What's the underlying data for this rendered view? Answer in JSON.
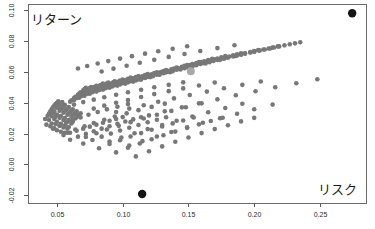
{
  "figure": {
    "width": 375,
    "height": 229,
    "background": "#ffffff",
    "plot_area": {
      "left": 28,
      "top": 4,
      "right": 366,
      "bottom": 203
    }
  },
  "labels": {
    "return_label": "リターン",
    "risk_label": "リスク"
  },
  "colors": {
    "point": "#787878",
    "highlight_dark": "#141414",
    "highlight_light": "#a9a9a9",
    "axis": "#5a5a5a",
    "text": "#1c1c1c"
  },
  "chart_data": {
    "type": "scatter",
    "title": "",
    "subtitle": "",
    "xlabel": "リスク",
    "ylabel": "リターン",
    "xlim": [
      0.028,
      0.285
    ],
    "ylim": [
      -0.025,
      0.104
    ],
    "grid": false,
    "legend": null,
    "xticks": [
      0.05,
      0.1,
      0.15,
      0.2,
      0.25
    ],
    "xticklabels": [
      "0.05",
      "0.10",
      "0.15",
      "0.20",
      "0.25"
    ],
    "yticks": [
      -0.02,
      0.0,
      0.02,
      0.04,
      0.06,
      0.08,
      0.1
    ],
    "yticklabels": [
      "-0.02",
      "0.00",
      "0.02",
      "0.04",
      "0.06",
      "0.08",
      "0.10"
    ],
    "marker_size": 2.3,
    "series": [
      {
        "name": "portfolios",
        "color": "#787878",
        "marker": "circle",
        "x": [
          0.041,
          0.043,
          0.044,
          0.045,
          0.046,
          0.047,
          0.048,
          0.049,
          0.05,
          0.051,
          0.042,
          0.044,
          0.046,
          0.047,
          0.048,
          0.05,
          0.051,
          0.052,
          0.053,
          0.054,
          0.045,
          0.046,
          0.048,
          0.049,
          0.05,
          0.052,
          0.053,
          0.054,
          0.055,
          0.056,
          0.047,
          0.049,
          0.05,
          0.052,
          0.053,
          0.055,
          0.056,
          0.057,
          0.058,
          0.059,
          0.05,
          0.052,
          0.053,
          0.055,
          0.056,
          0.058,
          0.059,
          0.06,
          0.061,
          0.062,
          0.053,
          0.055,
          0.056,
          0.058,
          0.059,
          0.061,
          0.062,
          0.063,
          0.064,
          0.065,
          0.056,
          0.058,
          0.059,
          0.061,
          0.062,
          0.064,
          0.065,
          0.066,
          0.067,
          0.068,
          0.06,
          0.061,
          0.063,
          0.064,
          0.066,
          0.067,
          0.068,
          0.07,
          0.071,
          0.072,
          0.063,
          0.065,
          0.066,
          0.068,
          0.069,
          0.071,
          0.072,
          0.073,
          0.075,
          0.076,
          0.067,
          0.069,
          0.07,
          0.072,
          0.073,
          0.075,
          0.076,
          0.078,
          0.079,
          0.08,
          0.071,
          0.073,
          0.074,
          0.076,
          0.077,
          0.079,
          0.08,
          0.082,
          0.083,
          0.085,
          0.075,
          0.077,
          0.079,
          0.08,
          0.082,
          0.083,
          0.085,
          0.086,
          0.088,
          0.089,
          0.08,
          0.082,
          0.083,
          0.085,
          0.087,
          0.088,
          0.09,
          0.091,
          0.093,
          0.094,
          0.085,
          0.087,
          0.089,
          0.09,
          0.092,
          0.094,
          0.095,
          0.097,
          0.098,
          0.1,
          0.09,
          0.092,
          0.094,
          0.096,
          0.097,
          0.099,
          0.101,
          0.102,
          0.104,
          0.106,
          0.096,
          0.098,
          0.1,
          0.101,
          0.103,
          0.105,
          0.107,
          0.108,
          0.11,
          0.112,
          0.102,
          0.104,
          0.106,
          0.108,
          0.11,
          0.111,
          0.113,
          0.115,
          0.117,
          0.119,
          0.108,
          0.11,
          0.112,
          0.114,
          0.116,
          0.118,
          0.12,
          0.122,
          0.124,
          0.126,
          0.114,
          0.117,
          0.119,
          0.121,
          0.123,
          0.125,
          0.127,
          0.129,
          0.131,
          0.133,
          0.121,
          0.123,
          0.126,
          0.128,
          0.13,
          0.132,
          0.134,
          0.137,
          0.139,
          0.141,
          0.128,
          0.131,
          0.133,
          0.135,
          0.138,
          0.14,
          0.142,
          0.145,
          0.147,
          0.149,
          0.136,
          0.138,
          0.141,
          0.143,
          0.146,
          0.148,
          0.151,
          0.153,
          0.156,
          0.158,
          0.144,
          0.147,
          0.149,
          0.152,
          0.155,
          0.157,
          0.16,
          0.162,
          0.165,
          0.168,
          0.153,
          0.156,
          0.159,
          0.161,
          0.164,
          0.167,
          0.17,
          0.172,
          0.175,
          0.178,
          0.163,
          0.166,
          0.169,
          0.172,
          0.175,
          0.178,
          0.181,
          0.184,
          0.187,
          0.19,
          0.174,
          0.177,
          0.18,
          0.184,
          0.187,
          0.19,
          0.193,
          0.197,
          0.2,
          0.203,
          0.186,
          0.19,
          0.193,
          0.197,
          0.2,
          0.204,
          0.207,
          0.211,
          0.214,
          0.218,
          0.2,
          0.204,
          0.208,
          0.212,
          0.215,
          0.219,
          0.223,
          0.227,
          0.231,
          0.235,
          0.055,
          0.06,
          0.065,
          0.07,
          0.075,
          0.08,
          0.085,
          0.09,
          0.095,
          0.1,
          0.06,
          0.066,
          0.072,
          0.078,
          0.084,
          0.09,
          0.096,
          0.102,
          0.108,
          0.114,
          0.07,
          0.077,
          0.084,
          0.091,
          0.098,
          0.105,
          0.112,
          0.119,
          0.126,
          0.133,
          0.082,
          0.09,
          0.098,
          0.106,
          0.114,
          0.122,
          0.13,
          0.138,
          0.146,
          0.154,
          0.095,
          0.104,
          0.113,
          0.122,
          0.131,
          0.14,
          0.149,
          0.158,
          0.167,
          0.176,
          0.11,
          0.12,
          0.13,
          0.14,
          0.15,
          0.16,
          0.17,
          0.18,
          0.19,
          0.2,
          0.048,
          0.052,
          0.057,
          0.062,
          0.068,
          0.074,
          0.081,
          0.088,
          0.096,
          0.104,
          0.058,
          0.064,
          0.071,
          0.078,
          0.086,
          0.094,
          0.103,
          0.112,
          0.122,
          0.132,
          0.072,
          0.08,
          0.088,
          0.097,
          0.106,
          0.116,
          0.126,
          0.137,
          0.148,
          0.16,
          0.09,
          0.099,
          0.109,
          0.119,
          0.13,
          0.141,
          0.153,
          0.165,
          0.178,
          0.191,
          0.105,
          0.115,
          0.126,
          0.137,
          0.149,
          0.161,
          0.174,
          0.187,
          0.2,
          0.214,
          0.063,
          0.07,
          0.078,
          0.086,
          0.095,
          0.104,
          0.114,
          0.124,
          0.135,
          0.146,
          0.078,
          0.086,
          0.095,
          0.104,
          0.114,
          0.124,
          0.135,
          0.146,
          0.158,
          0.17,
          0.095,
          0.105,
          0.116,
          0.127,
          0.139,
          0.151,
          0.164,
          0.177,
          0.191,
          0.205,
          0.12,
          0.132,
          0.145,
          0.158,
          0.172,
          0.186,
          0.201,
          0.216,
          0.232,
          0.248,
          0.066,
          0.073,
          0.081,
          0.089,
          0.098,
          0.107,
          0.117,
          0.127,
          0.138,
          0.149,
          0.084,
          0.093,
          0.103,
          0.113,
          0.124,
          0.135,
          0.147,
          0.159,
          0.172,
          0.185
        ],
        "y": [
          0.0295,
          0.0315,
          0.033,
          0.0345,
          0.0358,
          0.037,
          0.0381,
          0.0391,
          0.04,
          0.0409,
          0.0258,
          0.0288,
          0.0312,
          0.033,
          0.0345,
          0.0368,
          0.0378,
          0.0388,
          0.0397,
          0.0405,
          0.0248,
          0.0265,
          0.0295,
          0.031,
          0.0324,
          0.0348,
          0.0358,
          0.0368,
          0.0377,
          0.0386,
          0.0232,
          0.0262,
          0.0276,
          0.0302,
          0.0314,
          0.0336,
          0.0345,
          0.0355,
          0.0363,
          0.0372,
          0.0222,
          0.025,
          0.0263,
          0.0288,
          0.03,
          0.0322,
          0.0331,
          0.034,
          0.0349,
          0.0357,
          0.0212,
          0.024,
          0.0252,
          0.0276,
          0.0287,
          0.0309,
          0.0318,
          0.0327,
          0.0335,
          0.0344,
          0.0205,
          0.0231,
          0.0243,
          0.0266,
          0.0277,
          0.0298,
          0.0307,
          0.0315,
          0.0324,
          0.0332,
          0.0406,
          0.0415,
          0.043,
          0.0439,
          0.0452,
          0.046,
          0.0468,
          0.0481,
          0.0489,
          0.0496,
          0.0418,
          0.0431,
          0.0438,
          0.0451,
          0.0458,
          0.047,
          0.0477,
          0.0483,
          0.0495,
          0.0501,
          0.0432,
          0.0444,
          0.0451,
          0.0463,
          0.047,
          0.0481,
          0.0487,
          0.0498,
          0.0504,
          0.051,
          0.0446,
          0.0458,
          0.0464,
          0.0475,
          0.0481,
          0.0492,
          0.0498,
          0.0508,
          0.0514,
          0.0524,
          0.0458,
          0.0468,
          0.0478,
          0.0484,
          0.0494,
          0.05,
          0.051,
          0.0515,
          0.0524,
          0.053,
          0.0472,
          0.0482,
          0.0487,
          0.0497,
          0.0506,
          0.0511,
          0.052,
          0.0525,
          0.0534,
          0.0539,
          0.0485,
          0.0494,
          0.0503,
          0.0508,
          0.0517,
          0.0525,
          0.053,
          0.0538,
          0.0543,
          0.0551,
          0.0497,
          0.0506,
          0.0514,
          0.0522,
          0.0527,
          0.0535,
          0.0543,
          0.0547,
          0.0555,
          0.0563,
          0.0511,
          0.0519,
          0.0527,
          0.0531,
          0.0539,
          0.0546,
          0.0554,
          0.0558,
          0.0566,
          0.0573,
          0.0524,
          0.0532,
          0.0539,
          0.0546,
          0.0554,
          0.0558,
          0.0565,
          0.0572,
          0.0579,
          0.0586,
          0.0537,
          0.0544,
          0.0551,
          0.0558,
          0.0565,
          0.0572,
          0.0578,
          0.0585,
          0.0592,
          0.0598,
          0.055,
          0.056,
          0.0567,
          0.0573,
          0.058,
          0.0587,
          0.0593,
          0.0599,
          0.0606,
          0.0612,
          0.0566,
          0.0572,
          0.0582,
          0.0588,
          0.0594,
          0.0601,
          0.0607,
          0.0616,
          0.0622,
          0.0628,
          0.0581,
          0.0591,
          0.0597,
          0.0603,
          0.0613,
          0.0619,
          0.0625,
          0.0633,
          0.0639,
          0.0645,
          0.0598,
          0.0604,
          0.0614,
          0.062,
          0.0629,
          0.0635,
          0.0644,
          0.065,
          0.0658,
          0.0664,
          0.0615,
          0.0624,
          0.063,
          0.0639,
          0.0648,
          0.0654,
          0.0663,
          0.0668,
          0.0676,
          0.0684,
          0.0634,
          0.0643,
          0.0651,
          0.0657,
          0.0665,
          0.0673,
          0.0681,
          0.0687,
          0.0694,
          0.0702,
          0.0655,
          0.0663,
          0.0671,
          0.0678,
          0.0686,
          0.0693,
          0.07,
          0.0707,
          0.0714,
          0.0721,
          0.0678,
          0.0685,
          0.0692,
          0.07,
          0.0707,
          0.0714,
          0.0721,
          0.0729,
          0.0735,
          0.0741,
          0.0703,
          0.0711,
          0.0718,
          0.0725,
          0.0731,
          0.0739,
          0.0745,
          0.0752,
          0.0758,
          0.0765,
          0.0731,
          0.0738,
          0.0745,
          0.0752,
          0.0758,
          0.0765,
          0.0772,
          0.0779,
          0.0785,
          0.0792,
          0.019,
          0.0205,
          0.0218,
          0.0232,
          0.0245,
          0.0258,
          0.027,
          0.0283,
          0.0295,
          0.0307,
          0.016,
          0.018,
          0.0198,
          0.0215,
          0.0232,
          0.0248,
          0.0263,
          0.0278,
          0.0292,
          0.0306,
          0.0135,
          0.0158,
          0.018,
          0.02,
          0.022,
          0.0238,
          0.0256,
          0.0273,
          0.029,
          0.0306,
          0.0105,
          0.0132,
          0.0157,
          0.0181,
          0.0203,
          0.0225,
          0.0246,
          0.0266,
          0.0285,
          0.0304,
          0.0078,
          0.0108,
          0.0136,
          0.0163,
          0.0189,
          0.0213,
          0.0237,
          0.026,
          0.0282,
          0.0303,
          0.0052,
          0.0085,
          0.0117,
          0.0147,
          0.0175,
          0.0203,
          0.0229,
          0.0254,
          0.0279,
          0.0302,
          0.0235,
          0.0252,
          0.027,
          0.0288,
          0.0305,
          0.0322,
          0.034,
          0.0357,
          0.0374,
          0.0391,
          0.0205,
          0.0226,
          0.0248,
          0.0268,
          0.0289,
          0.031,
          0.0331,
          0.0352,
          0.0373,
          0.0394,
          0.0178,
          0.0202,
          0.0226,
          0.025,
          0.0274,
          0.0298,
          0.0322,
          0.0347,
          0.0371,
          0.0396,
          0.0148,
          0.0175,
          0.0202,
          0.0229,
          0.0256,
          0.0283,
          0.0311,
          0.0338,
          0.0366,
          0.0393,
          0.0122,
          0.0151,
          0.0181,
          0.021,
          0.024,
          0.027,
          0.0299,
          0.0329,
          0.0358,
          0.0388,
          0.0388,
          0.0404,
          0.042,
          0.0436,
          0.0452,
          0.0468,
          0.0484,
          0.05,
          0.0516,
          0.0532,
          0.0362,
          0.0381,
          0.04,
          0.0418,
          0.0437,
          0.0456,
          0.0475,
          0.0493,
          0.0512,
          0.0531,
          0.034,
          0.0362,
          0.0384,
          0.0406,
          0.0428,
          0.045,
          0.0472,
          0.0494,
          0.0516,
          0.0538,
          0.0318,
          0.0344,
          0.037,
          0.0396,
          0.0422,
          0.0448,
          0.0474,
          0.05,
          0.0526,
          0.0552,
          0.0622,
          0.0638,
          0.0654,
          0.067,
          0.0686,
          0.0702,
          0.0718,
          0.0734,
          0.075,
          0.0766,
          0.0602,
          0.0621,
          0.064,
          0.0659,
          0.0678,
          0.0697,
          0.0716,
          0.0735,
          0.0754,
          0.0773
        ]
      },
      {
        "name": "highlighted-dark",
        "color": "#141414",
        "marker": "circle",
        "marker_size": 4.2,
        "x": [
          0.2745,
          0.1148
        ],
        "y": [
          0.098,
          -0.0192
        ]
      },
      {
        "name": "highlighted-light",
        "color": "#a9a9a9",
        "marker": "circle",
        "marker_size": 4.0,
        "x": [
          0.1518
        ],
        "y": [
          0.0604
        ]
      }
    ],
    "annotations": [
      {
        "text": "リターン",
        "x_px": 31,
        "y_px": 20,
        "role": "y-axis-title-inline"
      },
      {
        "text": "リスク",
        "x_px": 319,
        "y_px": 190,
        "role": "x-axis-title-inline"
      }
    ]
  }
}
